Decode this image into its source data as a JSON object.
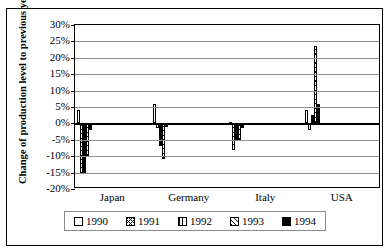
{
  "chart_data": {
    "type": "bar",
    "title": "",
    "xlabel": "",
    "ylabel": "Change of production level to previous year in %",
    "ylim": [
      -20,
      30
    ],
    "ytick_step": 5,
    "ytick_labels": [
      "30%",
      "25%",
      "20%",
      "15%",
      "10%",
      "5%",
      "0%",
      "-5%",
      "-10%",
      "-15%",
      "-20%"
    ],
    "ytick_values": [
      30,
      25,
      20,
      15,
      10,
      5,
      0,
      -5,
      -10,
      -15,
      -20
    ],
    "grid": true,
    "legend_position": "bottom",
    "categories": [
      "Japan",
      "Germany",
      "Italy",
      "USA"
    ],
    "series": [
      {
        "name": "1990",
        "pattern": "solid-white",
        "values": [
          4.0,
          6.0,
          0.5,
          4.0
        ]
      },
      {
        "name": "1991",
        "pattern": "cross-hatch",
        "values": [
          -15.0,
          -1.5,
          -8.0,
          -2.0
        ]
      },
      {
        "name": "1992",
        "pattern": "vertical-lines",
        "values": [
          -15.0,
          -7.0,
          -5.0,
          2.5
        ]
      },
      {
        "name": "1993",
        "pattern": "diagonal-hatch",
        "values": [
          -10.0,
          -11.0,
          -5.0,
          23.5
        ]
      },
      {
        "name": "1994",
        "pattern": "solid-black",
        "values": [
          -2.0,
          -1.0,
          -1.5,
          6.0
        ]
      }
    ]
  },
  "legend": {
    "items": [
      {
        "label": "1990"
      },
      {
        "label": "1991"
      },
      {
        "label": "1992"
      },
      {
        "label": "1993"
      },
      {
        "label": "1994"
      }
    ]
  },
  "colors": {
    "axis": "#000000",
    "grid": "#8e8e8e",
    "bar_fill": "#ffffff",
    "bar_solid": "#000000",
    "frame": "#000000"
  }
}
